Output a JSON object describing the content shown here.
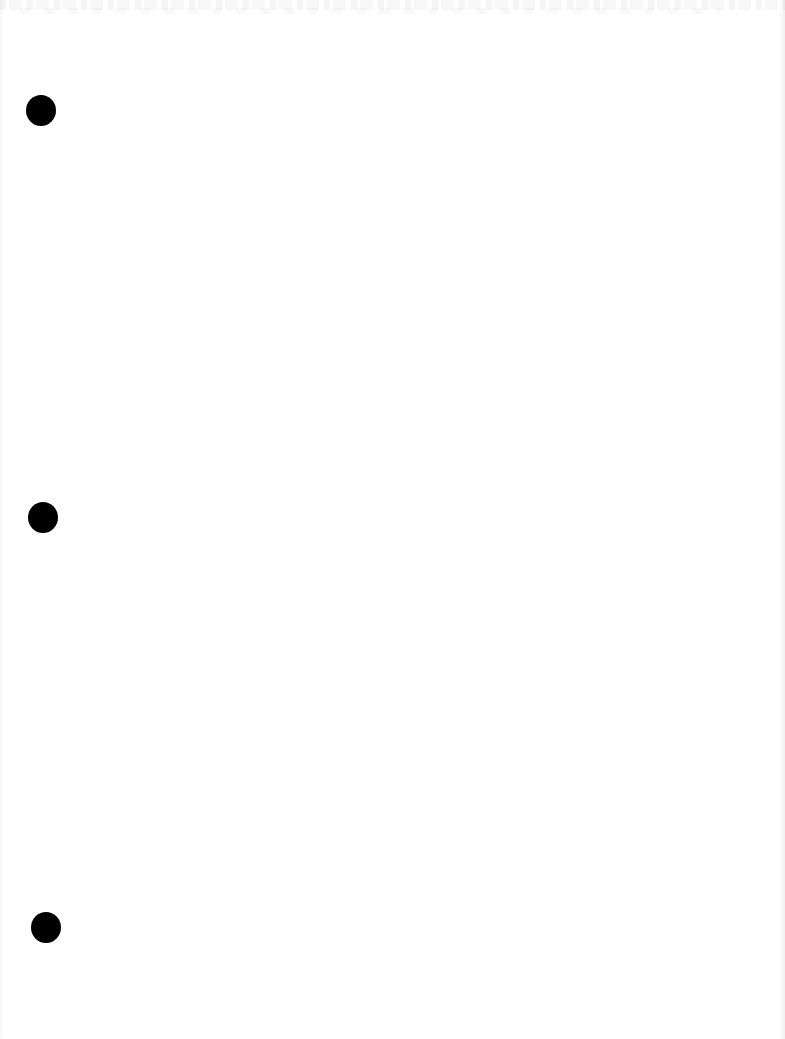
{
  "document": {
    "type": "scanned blank page",
    "background_color": "#ffffff",
    "text_content": "",
    "punch_holes": [
      {
        "label": "top",
        "color": "#000000"
      },
      {
        "label": "middle",
        "color": "#000000"
      },
      {
        "label": "bottom",
        "color": "#000000"
      }
    ],
    "artifacts": {
      "top_edge": "faint illegible bleed-through marks",
      "right_edge": "light gray scan shadow"
    }
  }
}
